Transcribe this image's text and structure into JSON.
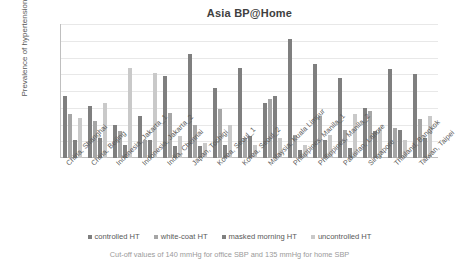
{
  "chart_data": {
    "type": "bar",
    "title": "Asia BP@Home",
    "xlabel": "",
    "ylabel": "Prevalence of hypertension status (%)",
    "ylim": [
      0,
      80
    ],
    "ytick_labels": [
      "80",
      "70",
      "60",
      "50",
      "40",
      "30",
      "20",
      "10",
      "0"
    ],
    "ytick_values": [
      80,
      70,
      60,
      50,
      40,
      30,
      20,
      10,
      0
    ],
    "grid": true,
    "legend_position": "bottom",
    "categories": [
      "China, Shanghai",
      "China, Beijing",
      "Indonesia, Jakarta_1",
      "Indonesia, Jakarta_2",
      "India, Chennai",
      "Japan, Tochigi",
      "Korea, Seoul_1",
      "Korea, Seoul_2",
      "Malaysia, Kuala Limpur",
      "Philippines, Manila_1",
      "Philippines, Manila_2",
      "Pakistan, Lahore",
      "Singapore",
      "Thailand, Bangkok",
      "Taiwan, Taipei"
    ],
    "series": [
      {
        "name": "controlled HT",
        "color": "#7f7f7f",
        "values": [
          37,
          31,
          20,
          25,
          49,
          62,
          42,
          54,
          33,
          71,
          56,
          48,
          30,
          53,
          50
        ]
      },
      {
        "name": "white-coat HT",
        "color": "#a6a6a6",
        "values": [
          26,
          22,
          16,
          11,
          27,
          20,
          29,
          12,
          35,
          14,
          25,
          17,
          28,
          18,
          23
        ]
      },
      {
        "name": "masked morning HT",
        "color": "#808080",
        "values": [
          11,
          12,
          8,
          11,
          7,
          7,
          8,
          13,
          37,
          5,
          11,
          6,
          16,
          17,
          12
        ]
      },
      {
        "name": "uncontrolled HT",
        "color": "#c9c9c9",
        "values": [
          24,
          33,
          54,
          51,
          13,
          9,
          20,
          8,
          12,
          8,
          14,
          26,
          18,
          11,
          25
        ]
      }
    ],
    "footnote": "Cut-off values of 140 mmHg for office SBP and 135 mmHg for home SBP"
  }
}
